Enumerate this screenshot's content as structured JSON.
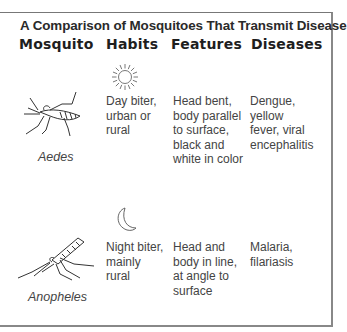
{
  "title": "A Comparison of Mosquitoes That Transmit Disease",
  "columns": [
    "Mosquito",
    "Habits",
    "Features",
    "Diseases"
  ],
  "rows": [
    {
      "mosquito": "Aedes",
      "habit_icon": "sun-icon",
      "habits": "Day biter,\nurban or\nrural",
      "features": "Head bent,\nbody parallel\nto surface,\nblack and\nwhite in color",
      "diseases": "Dengue,\nyellow\nfever, viral\nencephalitis"
    },
    {
      "mosquito": "Anopheles",
      "habit_icon": "moon-icon",
      "habits": "Night biter,\nmainly\nrural",
      "features": "Head and\nbody  in line,\nat angle to\nsurface",
      "diseases": "Malaria,\nfilariasis"
    }
  ]
}
